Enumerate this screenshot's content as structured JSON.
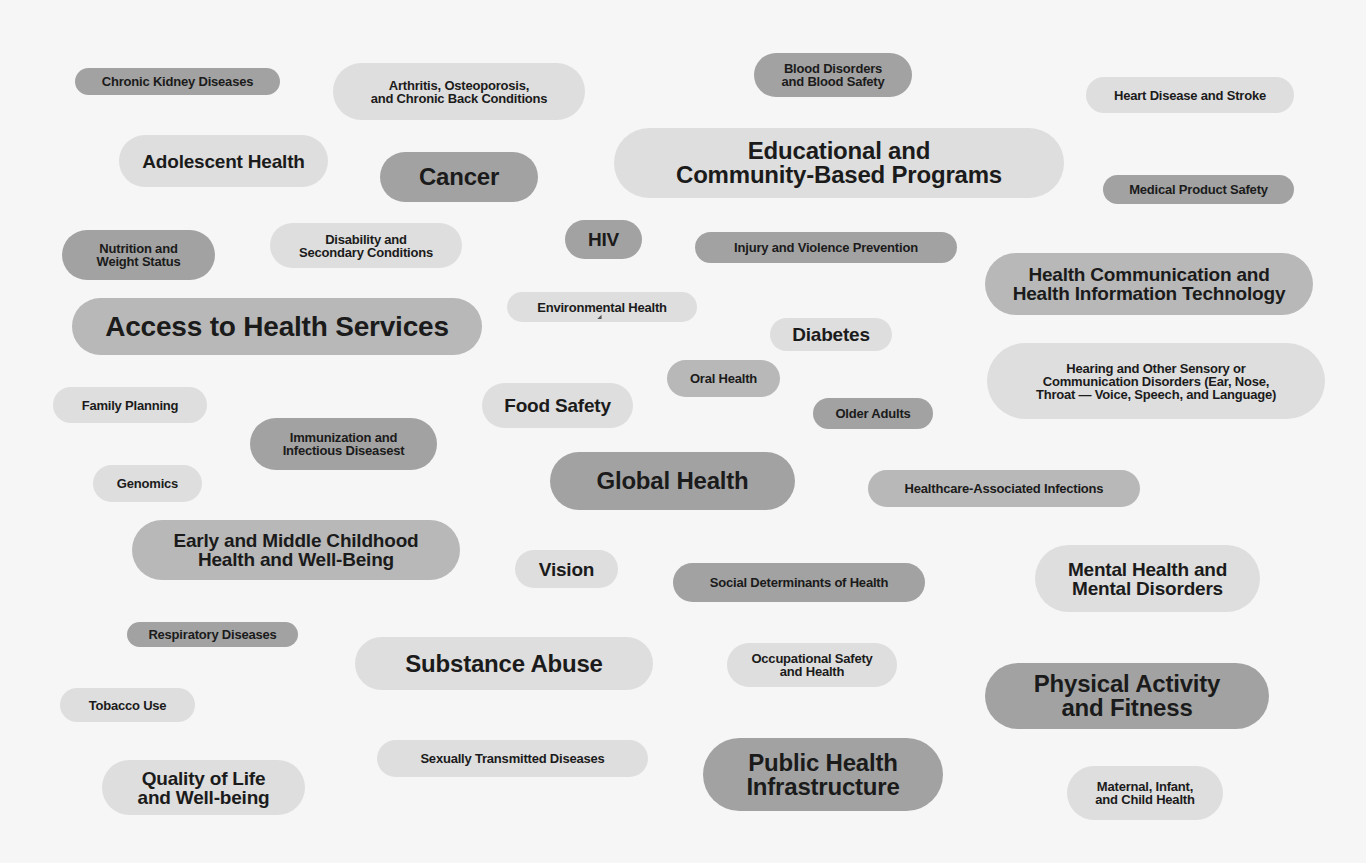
{
  "colors": {
    "background": "#f6f6f6",
    "pill_light": "#dedede",
    "pill_mid": "#b8b8b8",
    "pill_dark": "#a2a2a2",
    "text": "#1b1b1b"
  },
  "topics": [
    {
      "label": "Chronic Kidney Diseases",
      "shade": "dark"
    },
    {
      "label": "Arthritis, Osteoporosis,\nand Chronic Back Conditions",
      "shade": "light"
    },
    {
      "label": "Blood Disorders\nand Blood Safety",
      "shade": "dark"
    },
    {
      "label": "Heart Disease and Stroke",
      "shade": "light"
    },
    {
      "label": "Adolescent Health",
      "shade": "light"
    },
    {
      "label": "Cancer",
      "shade": "dark"
    },
    {
      "label": "Educational and\nCommunity-Based Programs",
      "shade": "light"
    },
    {
      "label": "Medical Product Safety",
      "shade": "dark"
    },
    {
      "label": "Nutrition and\nWeight Status",
      "shade": "dark"
    },
    {
      "label": "Disability and\nSecondary Conditions",
      "shade": "light"
    },
    {
      "label": "HIV",
      "shade": "dark"
    },
    {
      "label": "Injury and Violence Prevention",
      "shade": "dark"
    },
    {
      "label": "Health Communication and\nHealth Information Technology",
      "shade": "mid"
    },
    {
      "label": "Access to Health Services",
      "shade": "mid"
    },
    {
      "label": "Environmental Health",
      "shade": "light"
    },
    {
      "label": "Diabetes",
      "shade": "light"
    },
    {
      "label": "Hearing and Other Sensory or\nCommunication Disorders (Ear, Nose,\nThroat — Voice, Speech, and Language)",
      "shade": "light"
    },
    {
      "label": "Oral Health",
      "shade": "mid"
    },
    {
      "label": "Family Planning",
      "shade": "light"
    },
    {
      "label": "Food Safety",
      "shade": "light"
    },
    {
      "label": "Older Adults",
      "shade": "dark"
    },
    {
      "label": "Immunization and\nInfectious Diseasest",
      "shade": "dark"
    },
    {
      "label": "Genomics",
      "shade": "light"
    },
    {
      "label": "Global Health",
      "shade": "dark"
    },
    {
      "label": "Healthcare-Associated Infections",
      "shade": "mid"
    },
    {
      "label": "Early and Middle Childhood\nHealth and Well-Being",
      "shade": "mid"
    },
    {
      "label": "Vision",
      "shade": "light"
    },
    {
      "label": "Social Determinants of Health",
      "shade": "dark"
    },
    {
      "label": "Mental Health and\nMental Disorders",
      "shade": "light"
    },
    {
      "label": "Respiratory Diseases",
      "shade": "dark"
    },
    {
      "label": "Substance Abuse",
      "shade": "light"
    },
    {
      "label": "Occupational Safety\nand Health",
      "shade": "light"
    },
    {
      "label": "Physical Activity\nand Fitness",
      "shade": "dark"
    },
    {
      "label": "Tobacco Use",
      "shade": "light"
    },
    {
      "label": "Sexually Transmitted Diseases",
      "shade": "light"
    },
    {
      "label": "Public Health\nInfrastructure",
      "shade": "dark"
    },
    {
      "label": "Quality of Life\nand Well-being",
      "shade": "light"
    },
    {
      "label": "Maternal, Infant,\nand Child Health",
      "shade": "light"
    }
  ]
}
